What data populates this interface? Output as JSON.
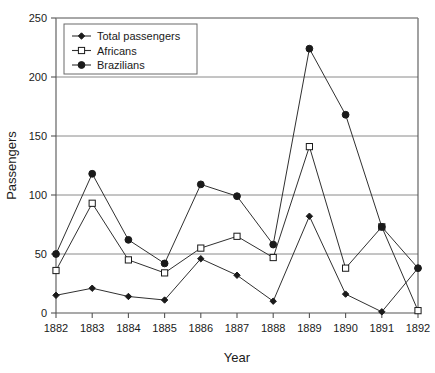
{
  "chart_data": {
    "type": "line",
    "title": "",
    "xlabel": "Year",
    "ylabel": "Passengers",
    "x": [
      1882,
      1883,
      1884,
      1885,
      1886,
      1887,
      1888,
      1889,
      1890,
      1891,
      1892
    ],
    "categories": [
      "1882",
      "1883",
      "1884",
      "1885",
      "1886",
      "1887",
      "1888",
      "1889",
      "1890",
      "1891",
      "1892"
    ],
    "xlim": [
      1882,
      1892
    ],
    "ylim": [
      0,
      250
    ],
    "yticks": [
      0,
      50,
      100,
      150,
      200,
      250
    ],
    "ytick_labels": [
      "0",
      "50",
      "100",
      "150",
      "200",
      "250"
    ],
    "grid": "horizontal",
    "legend_position": "top-left-inside",
    "series": [
      {
        "name": "Total passengers",
        "marker": "diamond-filled",
        "values": [
          15,
          21,
          14,
          11,
          46,
          32,
          10,
          82,
          16,
          1,
          38
        ]
      },
      {
        "name": "Africans",
        "marker": "square-open",
        "values": [
          36,
          93,
          45,
          34,
          55,
          65,
          47,
          141,
          38,
          73,
          2
        ]
      },
      {
        "name": "Brazilians",
        "marker": "circle-filled",
        "values": [
          50,
          118,
          62,
          42,
          109,
          99,
          58,
          224,
          168,
          73,
          38
        ]
      }
    ]
  },
  "legend": {
    "entries": [
      {
        "label": "Total passengers"
      },
      {
        "label": "Africans"
      },
      {
        "label": "Brazilians"
      }
    ]
  },
  "colors": {
    "line": "#303030",
    "grid": "#8a8a8a",
    "axis": "#555555",
    "text": "#1a1a1a",
    "background": "#ffffff"
  }
}
